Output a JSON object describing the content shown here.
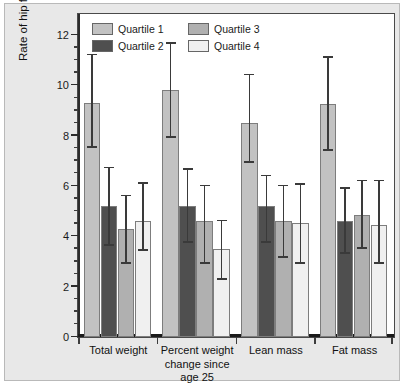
{
  "figure": {
    "background_color": "#e8e8e8",
    "plot_background_color": "#ffffff",
    "frame_color": "#4a4a4a"
  },
  "chart_data": {
    "type": "bar",
    "title": "",
    "xlabel": "",
    "ylabel": "Rate of hip fracture/1,000 woman-years",
    "ylim": [
      0,
      12.8
    ],
    "ytick_values": [
      0,
      2,
      4,
      6,
      8,
      10,
      12
    ],
    "ytick_labels": [
      "0",
      "2",
      "4",
      "6",
      "8",
      "10",
      "12"
    ],
    "yminor_step": 0.5,
    "grid": false,
    "legend_position": "top-left inside plot",
    "categories": [
      "Total weight",
      "Percent weight change since age 25",
      "Lean mass",
      "Fat mass"
    ],
    "category_label_lines": [
      [
        "Total weight"
      ],
      [
        "Percent weight",
        "change since",
        "age 25"
      ],
      [
        "Lean mass"
      ],
      [
        "Fat mass"
      ]
    ],
    "series": [
      {
        "name": "Quartile 1",
        "color": "#c2c2c2",
        "values": [
          9.3,
          9.8,
          8.5,
          9.25
        ],
        "error_low": [
          7.5,
          7.9,
          6.9,
          7.4
        ],
        "error_high": [
          11.2,
          11.65,
          10.4,
          11.1
        ]
      },
      {
        "name": "Quartile 2",
        "color": "#4f4f4f",
        "values": [
          5.2,
          5.2,
          5.2,
          4.6
        ],
        "error_low": [
          3.6,
          3.75,
          3.75,
          3.3
        ],
        "error_high": [
          6.7,
          6.65,
          6.4,
          5.9
        ]
      },
      {
        "name": "Quartile 3",
        "color": "#b0b0b0",
        "values": [
          4.3,
          4.6,
          4.6,
          4.85
        ],
        "error_low": [
          2.9,
          2.9,
          3.15,
          3.5
        ],
        "error_high": [
          5.6,
          6.0,
          6.0,
          6.2
        ]
      },
      {
        "name": "Quartile 4",
        "color": "#f0f0f0",
        "values": [
          4.6,
          3.5,
          4.55,
          4.45
        ],
        "error_low": [
          3.4,
          2.25,
          2.9,
          2.9
        ],
        "error_high": [
          6.1,
          4.6,
          6.05,
          6.2
        ]
      }
    ]
  },
  "legend": {
    "entries": [
      {
        "label": "Quartile 1",
        "color": "#c2c2c2"
      },
      {
        "label": "Quartile 2",
        "color": "#4f4f4f"
      },
      {
        "label": "Quartile 3",
        "color": "#b0b0b0"
      },
      {
        "label": "Quartile 4",
        "color": "#f0f0f0"
      }
    ]
  }
}
